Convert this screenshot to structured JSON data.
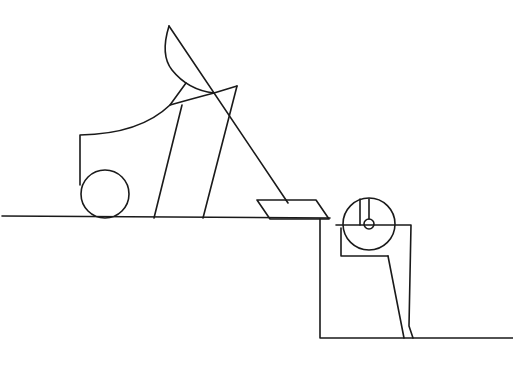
{
  "diagram": {
    "title": "",
    "stroke_color": "#1a1a1a",
    "background_color": "#ffffff",
    "width": 513,
    "height": 388,
    "components": [
      {
        "id": "upper-ground",
        "label": ""
      },
      {
        "id": "left-body",
        "label": ""
      },
      {
        "id": "left-wheel",
        "label": ""
      },
      {
        "id": "lever-arm",
        "label": ""
      },
      {
        "id": "support-legs",
        "label": ""
      },
      {
        "id": "plate",
        "label": ""
      },
      {
        "id": "pit",
        "label": ""
      },
      {
        "id": "pulley-wheel",
        "label": ""
      },
      {
        "id": "pulley-frame",
        "label": ""
      },
      {
        "id": "lower-ground",
        "label": ""
      }
    ]
  }
}
